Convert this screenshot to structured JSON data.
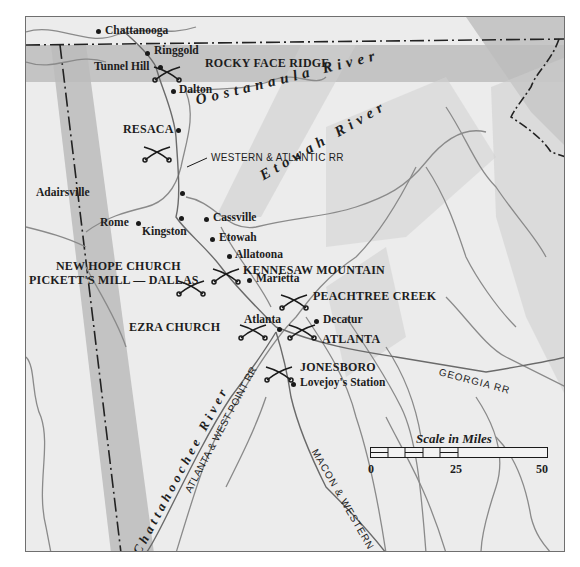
{
  "map": {
    "colors": {
      "land": "#ececec",
      "band_shade": "#b9b9b9",
      "river_line": "#8d8d8d",
      "border_line": "#222222",
      "text": "#1d1d1d"
    },
    "towns": [
      {
        "name": "Chattanooga"
      },
      {
        "name": "Ringgold"
      },
      {
        "name": "Tunnel Hill"
      },
      {
        "name": "Dalton"
      },
      {
        "name": "Adairsville"
      },
      {
        "name": "Rome"
      },
      {
        "name": "Kingston"
      },
      {
        "name": "Cassville"
      },
      {
        "name": "Etowah"
      },
      {
        "name": "Allatoona"
      },
      {
        "name": "Marietta"
      },
      {
        "name": "Atlanta"
      },
      {
        "name": "Decatur"
      },
      {
        "name": "Lovejoy's Station"
      }
    ],
    "battles": [
      {
        "name": "ROCKY FACE RIDGE"
      },
      {
        "name": "RESACA"
      },
      {
        "name": "NEW HOPE CHURCH"
      },
      {
        "name": "PICKETT'S MILL — DALLAS"
      },
      {
        "name": "KENNESAW MOUNTAIN"
      },
      {
        "name": "PEACHTREE CREEK"
      },
      {
        "name": "EZRA CHURCH"
      },
      {
        "name": "ATLANTA"
      },
      {
        "name": "JONESBORO"
      }
    ],
    "rivers": [
      {
        "name": "Oostanaula River"
      },
      {
        "name": "Etowah River"
      },
      {
        "name": "Chattahoochee River"
      }
    ],
    "railroads": [
      {
        "name": "WESTERN & ATLANTIC RR"
      },
      {
        "name": "GEORGIA RR"
      },
      {
        "name": "ATLANTA & WEST POINT RR"
      },
      {
        "name": "MACON & WESTERN RR"
      }
    ],
    "scale": {
      "title": "Scale in Miles",
      "ticks": [
        "0",
        "25",
        "50"
      ]
    }
  }
}
